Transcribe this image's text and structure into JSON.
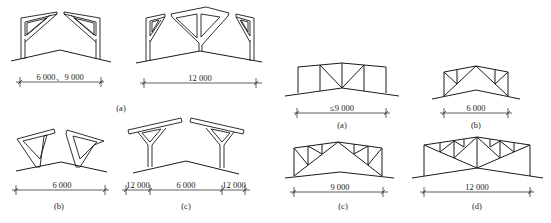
{
  "left_group": {
    "a": {
      "caption": "(a)",
      "frame1": {
        "dimension": "6 000、9 000"
      },
      "frame2": {
        "dimension": "12 000"
      }
    },
    "b": {
      "caption": "(b)",
      "dimension": "6 000"
    },
    "c": {
      "caption": "(c)",
      "dimensions": [
        "12 000",
        "6 000",
        "12 000"
      ]
    }
  },
  "right_group": {
    "a": {
      "caption": "(a)",
      "dimension": "≤9 000"
    },
    "b": {
      "caption": "(b)",
      "dimension": "6 000"
    },
    "c": {
      "caption": "(c)",
      "dimension": "9 000"
    },
    "d": {
      "caption": "(d)",
      "dimension": "12 000"
    }
  },
  "colors": {
    "line": "#1a1a1a",
    "background": "#ffffff"
  }
}
